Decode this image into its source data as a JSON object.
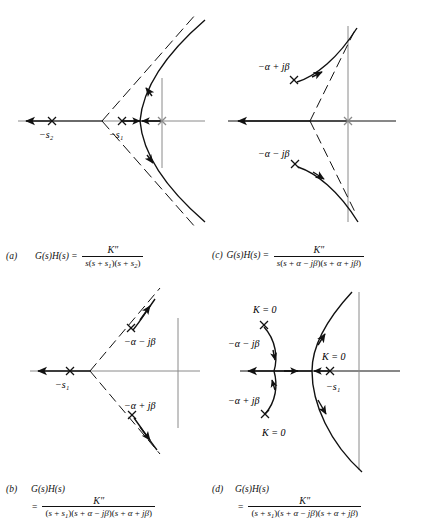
{
  "figure": {
    "background": "#ffffff",
    "ink": "#111111",
    "axis_gray": "#8a8a8a"
  },
  "panels": [
    {
      "tag": "(a)",
      "lhs": "G(s)H(s)",
      "equals": "=",
      "numerator": "K″",
      "denominator_parts": [
        "s(s",
        "+",
        "s",
        "1",
        ")(s",
        "+",
        "s",
        "2",
        ")"
      ],
      "denominator": "s(s + s1)(s + s2)",
      "pole_labels": [
        {
          "name": "pole-s2",
          "text": "−s",
          "sub": "2"
        },
        {
          "name": "pole-s1",
          "text": "−s",
          "sub": "1"
        },
        {
          "name": "pole-origin",
          "text": ""
        }
      ],
      "annotations": []
    },
    {
      "tag": "(c)",
      "lhs": "G(s)H(s)",
      "equals": "=",
      "numerator": "K″",
      "denominator": "s(s + α − jβ)(s + α + jβ)",
      "pole_labels": [
        {
          "name": "pole-upper",
          "text": "−α + jβ"
        },
        {
          "name": "pole-lower",
          "text": "−α − jβ"
        }
      ],
      "annotations": []
    },
    {
      "tag": "(b)",
      "lhs": "G(s)H(s)",
      "equals": "=",
      "numerator": "K″",
      "denominator": "(s + s1)(s + α − jβ)(s + α + jβ)",
      "pole_labels": [
        {
          "name": "pole-s1",
          "text": "−s",
          "sub": "1"
        },
        {
          "name": "pole-upper",
          "text": "−α − jβ"
        },
        {
          "name": "pole-lower",
          "text": "−α + jβ"
        }
      ],
      "annotations": []
    },
    {
      "tag": "(d)",
      "lhs": "G(s)H(s)",
      "equals": "=",
      "numerator": "K″",
      "denominator": "(s + s1)(s + α − jβ)(s + α + jβ)",
      "pole_labels": [
        {
          "name": "pole-upper",
          "text": "−α − jβ"
        },
        {
          "name": "pole-lower",
          "text": "−α + jβ"
        },
        {
          "name": "pole-s1",
          "text": "−s",
          "sub": "1"
        }
      ],
      "annotations": [
        {
          "name": "k-zero-upper",
          "text": "K = 0"
        },
        {
          "name": "k-zero-real",
          "text": "K = 0"
        },
        {
          "name": "k-zero-lower",
          "text": "K = 0"
        }
      ]
    }
  ],
  "symbols": {
    "numerator": "K″",
    "k_equals_zero": "K = 0",
    "minus_alpha_plus_jbeta": "−α + jβ",
    "minus_alpha_minus_jbeta": "−α − jβ",
    "minus_s1": "−s₁",
    "minus_s2": "−s₂",
    "gh": "G(s)H(s)",
    "equals": "=",
    "pole_marker": "×"
  },
  "labels": {
    "a_tag": "(a)",
    "b_tag": "(b)",
    "c_tag": "(c)",
    "d_tag": "(d)",
    "s_var": "s",
    "alpha": "α",
    "beta": "β",
    "j": "j",
    "plus": "+",
    "minus": "−",
    "open_paren": "(",
    "close_paren": ")"
  }
}
